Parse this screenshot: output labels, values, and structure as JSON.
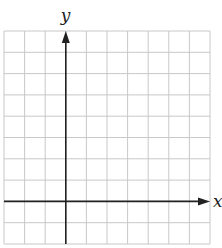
{
  "diagram": {
    "type": "coordinate-plane",
    "x_axis_label": "x",
    "y_axis_label": "y",
    "grid": {
      "columns": 10,
      "rows": 10,
      "left": 4,
      "top": 31,
      "right": 210,
      "bottom": 244,
      "line_color": "#c8c8c8"
    },
    "axes": {
      "y_axis_column_index": 3,
      "x_axis_row_index": 8,
      "color": "#222222"
    }
  }
}
